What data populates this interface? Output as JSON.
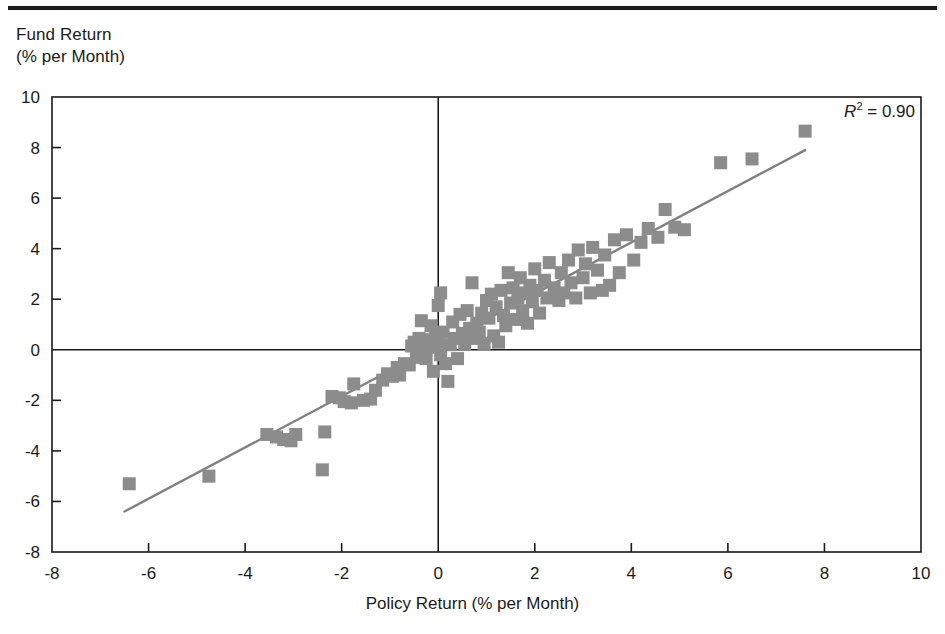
{
  "figure": {
    "top_rule": "horizontal-rule",
    "y_axis_title": "Fund Return\n(% per Month)",
    "x_axis_title": "Policy Return (% per Month)",
    "annotation_prefix": "R",
    "annotation_exponent": "2",
    "annotation_value": "= 0.90"
  },
  "colors": {
    "marker": "#8c8c8c",
    "line": "#808080",
    "axis": "#1a1a1a",
    "background": "#ffffff"
  },
  "chart_data": {
    "type": "scatter",
    "title": "",
    "xlabel": "Policy Return (% per Month)",
    "ylabel": "Fund Return (% per Month)",
    "xlim": [
      -8,
      10
    ],
    "ylim": [
      -8,
      10
    ],
    "xticks": [
      -8,
      -6,
      -4,
      -2,
      0,
      2,
      4,
      6,
      8,
      10
    ],
    "yticks": [
      -8,
      -6,
      -4,
      -2,
      0,
      2,
      4,
      6,
      8,
      10
    ],
    "xtick_labels": [
      "-8",
      "-6",
      "-4",
      "-2",
      "0",
      "2",
      "4",
      "6",
      "8",
      "10"
    ],
    "ytick_labels": [
      "-8",
      "-6",
      "-4",
      "-2",
      "0",
      "2",
      "4",
      "6",
      "8",
      "10"
    ],
    "grid": false,
    "legend": null,
    "annotations": [
      {
        "text": "R2 = 0.90",
        "x": 8.2,
        "y": 9.1,
        "statistic": "R-squared",
        "value": 0.9
      }
    ],
    "zero_lines": {
      "vertical_at_x": 0,
      "horizontal_at_y": 0
    },
    "marker_style": "filled-square",
    "series": [
      {
        "name": "Fund vs Policy Return",
        "points": [
          [
            -6.4,
            -5.3
          ],
          [
            -4.75,
            -5.0
          ],
          [
            -3.55,
            -3.35
          ],
          [
            -3.35,
            -3.45
          ],
          [
            -3.2,
            -3.55
          ],
          [
            -3.05,
            -3.6
          ],
          [
            -2.95,
            -3.35
          ],
          [
            -2.4,
            -4.75
          ],
          [
            -2.35,
            -3.25
          ],
          [
            -2.2,
            -1.85
          ],
          [
            -2.05,
            -1.9
          ],
          [
            -1.95,
            -2.05
          ],
          [
            -1.8,
            -2.1
          ],
          [
            -1.75,
            -1.35
          ],
          [
            -1.55,
            -2.0
          ],
          [
            -1.4,
            -1.95
          ],
          [
            -1.3,
            -1.6
          ],
          [
            -1.15,
            -1.2
          ],
          [
            -1.05,
            -0.95
          ],
          [
            -0.95,
            -1.05
          ],
          [
            -0.85,
            -0.7
          ],
          [
            -0.8,
            -1.0
          ],
          [
            -0.7,
            -0.55
          ],
          [
            -0.6,
            -0.6
          ],
          [
            -0.55,
            0.15
          ],
          [
            -0.5,
            0.3
          ],
          [
            -0.45,
            -0.3
          ],
          [
            -0.4,
            0.45
          ],
          [
            -0.35,
            1.15
          ],
          [
            -0.3,
            0.0
          ],
          [
            -0.25,
            -0.35
          ],
          [
            -0.2,
            0.4
          ],
          [
            -0.15,
            0.95
          ],
          [
            -0.1,
            0.1
          ],
          [
            -0.1,
            -0.85
          ],
          [
            -0.05,
            0.55
          ],
          [
            0.0,
            0.3
          ],
          [
            0.0,
            1.75
          ],
          [
            0.05,
            2.25
          ],
          [
            0.05,
            -0.2
          ],
          [
            0.1,
            0.7
          ],
          [
            0.15,
            -0.55
          ],
          [
            0.2,
            -1.25
          ],
          [
            0.25,
            0.2
          ],
          [
            0.3,
            1.1
          ],
          [
            0.35,
            0.45
          ],
          [
            0.4,
            -0.35
          ],
          [
            0.45,
            1.4
          ],
          [
            0.5,
            0.65
          ],
          [
            0.55,
            0.25
          ],
          [
            0.6,
            1.55
          ],
          [
            0.65,
            0.85
          ],
          [
            0.7,
            2.65
          ],
          [
            0.75,
            0.45
          ],
          [
            0.8,
            1.05
          ],
          [
            0.85,
            0.7
          ],
          [
            0.9,
            1.45
          ],
          [
            0.95,
            0.25
          ],
          [
            1.0,
            1.95
          ],
          [
            1.05,
            1.25
          ],
          [
            1.1,
            2.2
          ],
          [
            1.15,
            0.55
          ],
          [
            1.2,
            1.7
          ],
          [
            1.25,
            0.3
          ],
          [
            1.3,
            2.35
          ],
          [
            1.35,
            1.35
          ],
          [
            1.4,
            0.95
          ],
          [
            1.45,
            3.05
          ],
          [
            1.5,
            1.85
          ],
          [
            1.55,
            2.45
          ],
          [
            1.6,
            1.2
          ],
          [
            1.65,
            2.05
          ],
          [
            1.7,
            2.85
          ],
          [
            1.75,
            1.55
          ],
          [
            1.8,
            2.25
          ],
          [
            1.85,
            1.05
          ],
          [
            1.9,
            2.55
          ],
          [
            1.95,
            1.9
          ],
          [
            2.0,
            3.2
          ],
          [
            2.05,
            2.35
          ],
          [
            2.1,
            1.45
          ],
          [
            2.2,
            2.75
          ],
          [
            2.25,
            2.05
          ],
          [
            2.3,
            3.45
          ],
          [
            2.4,
            2.45
          ],
          [
            2.5,
            1.95
          ],
          [
            2.55,
            3.05
          ],
          [
            2.6,
            2.25
          ],
          [
            2.7,
            3.55
          ],
          [
            2.75,
            2.65
          ],
          [
            2.85,
            2.05
          ],
          [
            2.9,
            3.95
          ],
          [
            3.0,
            2.85
          ],
          [
            3.05,
            3.4
          ],
          [
            3.15,
            2.25
          ],
          [
            3.2,
            4.05
          ],
          [
            3.3,
            3.15
          ],
          [
            3.4,
            2.35
          ],
          [
            3.45,
            3.75
          ],
          [
            3.55,
            2.55
          ],
          [
            3.65,
            4.35
          ],
          [
            3.75,
            3.05
          ],
          [
            3.9,
            4.55
          ],
          [
            4.05,
            3.55
          ],
          [
            4.2,
            4.25
          ],
          [
            4.35,
            4.8
          ],
          [
            4.55,
            4.45
          ],
          [
            4.7,
            5.55
          ],
          [
            4.9,
            4.85
          ],
          [
            5.1,
            4.75
          ],
          [
            5.85,
            7.4
          ],
          [
            6.5,
            7.55
          ],
          [
            7.6,
            8.65
          ]
        ]
      }
    ],
    "trendline": {
      "type": "linear-regression",
      "x_start": -6.5,
      "y_start": -6.4,
      "x_end": 7.6,
      "y_end": 7.9,
      "r_squared": 0.9
    }
  }
}
